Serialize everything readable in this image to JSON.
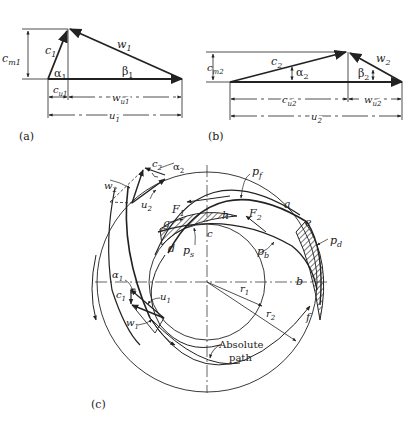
{
  "figure": {
    "panels": [
      {
        "id": "a",
        "caption": "(a)",
        "title": "Inlet velocity triangle",
        "labels": {
          "c": "c",
          "c_sub": "1",
          "w": "w",
          "w_sub": "1",
          "alpha": "α",
          "alpha_sub": "1",
          "beta": "β",
          "beta_sub": "1",
          "cm": "c",
          "cm_sub": "m1",
          "cu": "c",
          "cu_sub": "u1",
          "wu": "w",
          "wu_sub": "u1",
          "u": "u",
          "u_sub": "1"
        }
      },
      {
        "id": "b",
        "caption": "(b)",
        "title": "Outlet velocity triangle",
        "labels": {
          "c": "c",
          "c_sub": "2",
          "w": "w",
          "w_sub": "2",
          "alpha": "α",
          "alpha_sub": "2",
          "beta": "β",
          "beta_sub": "2",
          "cm": "c",
          "cm_sub": "m2",
          "cu": "c",
          "cu_sub": "u2",
          "wu": "w",
          "wu_sub": "u2",
          "u": "u",
          "u_sub": "2"
        }
      },
      {
        "id": "c",
        "caption": "(c)",
        "title": "Impeller passage with forces and pressures",
        "labels": {
          "c2": "c",
          "c2_sub": "2",
          "alpha2": "α",
          "alpha2_sub": "2",
          "w2": "w",
          "w2_sub": "2",
          "u2": "u",
          "u2_sub": "2",
          "F1": "F",
          "F1_sub": "1",
          "F2": "F",
          "F2_sub": "2",
          "pf": "p",
          "pf_sub": "f",
          "pd": "p",
          "pd_sub": "d",
          "ps": "p",
          "ps_sub": "s",
          "pb": "p",
          "pb_sub": "b",
          "a": "a",
          "b": "b",
          "c": "c",
          "d": "d",
          "e": "e",
          "f": "f",
          "g": "g",
          "h": "h",
          "r1": "r",
          "r1_sub": "1",
          "r2": "r",
          "r2_sub": "2",
          "alpha1": "α",
          "alpha1_sub": "1",
          "c1": "c",
          "c1_sub": "1",
          "u1": "u",
          "u1_sub": "1",
          "w1": "w",
          "w1_sub": "1",
          "absolute_path_line1": "Absolute",
          "absolute_path_line2": "path"
        }
      }
    ]
  },
  "colors": {
    "ink": "#222222",
    "background": "#ffffff"
  }
}
